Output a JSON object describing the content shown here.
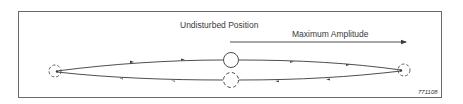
{
  "diagram": {
    "labels": {
      "undisturbed_position": "Undisturbed Position",
      "maximum_amplitude": "Maximum Amplitude",
      "figure_id": "771108"
    },
    "elements": {
      "center_circle_solid": "undisturbed-position-marker",
      "center_circle_dashed": "return-pass-marker",
      "left_circle_dashed": "left-extreme-position",
      "right_circle_dashed": "right-extreme-position",
      "upper_path_direction": "left-to-right",
      "lower_path_direction": "right-to-left",
      "amplitude_arrow_direction": "right"
    },
    "colors": {
      "line": "#3a3a3a",
      "frame": "#6a6a6a",
      "background": "#ffffff"
    }
  }
}
